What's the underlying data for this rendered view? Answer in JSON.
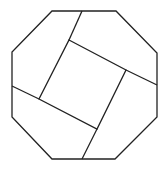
{
  "diagram": {
    "stroke_color": "#222222",
    "background": "#ffffff",
    "octagon_points": "52,11 116,11 157,53 157,117 115,159 52,159 12,117 12,52",
    "inner_square_points": "69,40 126,70 97,129 39,99",
    "cut_lines": [
      {
        "x1": 82,
        "y1": 11,
        "x2": 69,
        "y2": 40
      },
      {
        "x1": 126,
        "y1": 70,
        "x2": 157,
        "y2": 85
      },
      {
        "x1": 97,
        "y1": 129,
        "x2": 82,
        "y2": 159
      },
      {
        "x1": 39,
        "y1": 99,
        "x2": 12,
        "y2": 86
      }
    ]
  }
}
